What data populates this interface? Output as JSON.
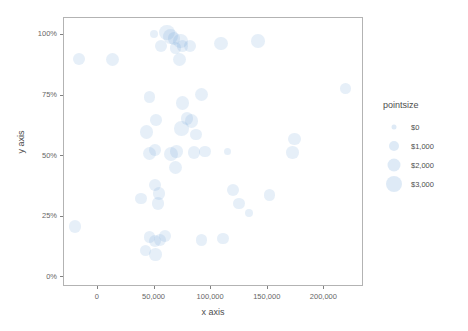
{
  "chart_data": {
    "type": "scatter",
    "title": "",
    "xlabel": "x axis",
    "ylabel": "y axis",
    "xlim": [
      -30000,
      235000
    ],
    "ylim": [
      -0.04,
      1.07
    ],
    "grid": false,
    "legend": {
      "position": "right",
      "title": "pointsize",
      "entries": [
        {
          "label": "$0",
          "value": 0,
          "diameter_px": 5
        },
        {
          "label": "$1,000",
          "value": 1000,
          "diameter_px": 10
        },
        {
          "label": "$2,000",
          "value": 2000,
          "diameter_px": 13
        },
        {
          "label": "$3,000",
          "value": 3000,
          "diameter_px": 16
        }
      ]
    },
    "xticks": [
      {
        "value": 0,
        "label": "0"
      },
      {
        "value": 50000,
        "label": "50,000"
      },
      {
        "value": 100000,
        "label": "100,000"
      },
      {
        "value": 150000,
        "label": "150,000"
      },
      {
        "value": 200000,
        "label": "200,000"
      }
    ],
    "yticks": [
      {
        "value": 0,
        "label": "0%"
      },
      {
        "value": 0.25,
        "label": "25%"
      },
      {
        "value": 0.5,
        "label": "50%"
      },
      {
        "value": 0.75,
        "label": "75%"
      },
      {
        "value": 1.0,
        "label": "100%"
      }
    ],
    "point_color": "#6b9fd4",
    "point_opacity": 0.17,
    "size_key": "pointsize",
    "points": [
      {
        "x": 61000,
        "y": 1.01,
        "size": 2600
      },
      {
        "x": 64000,
        "y": 0.995,
        "size": 2500
      },
      {
        "x": 67000,
        "y": 0.985,
        "size": 1500
      },
      {
        "x": 72500,
        "y": 0.975,
        "size": 2500
      },
      {
        "x": 74500,
        "y": 0.955,
        "size": 1100
      },
      {
        "x": 68500,
        "y": 0.945,
        "size": 1300
      },
      {
        "x": 49500,
        "y": 1.005,
        "size": 300
      },
      {
        "x": 55500,
        "y": 0.955,
        "size": 1500
      },
      {
        "x": 72000,
        "y": 0.9,
        "size": 1800
      },
      {
        "x": 81500,
        "y": 0.955,
        "size": 1500
      },
      {
        "x": 108500,
        "y": 0.965,
        "size": 1900
      },
      {
        "x": 141500,
        "y": 0.975,
        "size": 1900
      },
      {
        "x": -16500,
        "y": 0.9,
        "size": 1300
      },
      {
        "x": 13000,
        "y": 0.9,
        "size": 1700
      },
      {
        "x": 218500,
        "y": 0.78,
        "size": 900
      },
      {
        "x": 45500,
        "y": 0.745,
        "size": 1200
      },
      {
        "x": 91500,
        "y": 0.755,
        "size": 1700
      },
      {
        "x": 74500,
        "y": 0.72,
        "size": 1900
      },
      {
        "x": 51500,
        "y": 0.65,
        "size": 1200
      },
      {
        "x": 78500,
        "y": 0.655,
        "size": 1500
      },
      {
        "x": 82500,
        "y": 0.645,
        "size": 1800
      },
      {
        "x": 74000,
        "y": 0.615,
        "size": 2300
      },
      {
        "x": 43000,
        "y": 0.6,
        "size": 1800
      },
      {
        "x": 86500,
        "y": 0.59,
        "size": 1200
      },
      {
        "x": 173500,
        "y": 0.57,
        "size": 1500
      },
      {
        "x": 50500,
        "y": 0.525,
        "size": 1200
      },
      {
        "x": 45500,
        "y": 0.51,
        "size": 1700
      },
      {
        "x": 64500,
        "y": 0.51,
        "size": 2200
      },
      {
        "x": 69500,
        "y": 0.52,
        "size": 1600
      },
      {
        "x": 85000,
        "y": 0.515,
        "size": 1400
      },
      {
        "x": 94500,
        "y": 0.52,
        "size": 1100
      },
      {
        "x": 172000,
        "y": 0.515,
        "size": 1500
      },
      {
        "x": 68500,
        "y": 0.455,
        "size": 1700
      },
      {
        "x": 114500,
        "y": 0.52,
        "size": 200
      },
      {
        "x": 50500,
        "y": 0.38,
        "size": 1300
      },
      {
        "x": 54000,
        "y": 0.345,
        "size": 1500
      },
      {
        "x": 38000,
        "y": 0.325,
        "size": 1300
      },
      {
        "x": 53000,
        "y": 0.305,
        "size": 1600
      },
      {
        "x": 119500,
        "y": 0.36,
        "size": 1400
      },
      {
        "x": 151500,
        "y": 0.34,
        "size": 1100
      },
      {
        "x": 124500,
        "y": 0.305,
        "size": 1100
      },
      {
        "x": -20500,
        "y": 0.21,
        "size": 1400
      },
      {
        "x": 133500,
        "y": 0.265,
        "size": 400
      },
      {
        "x": 45500,
        "y": 0.165,
        "size": 1300
      },
      {
        "x": 50500,
        "y": 0.15,
        "size": 1500
      },
      {
        "x": 55000,
        "y": 0.155,
        "size": 1500
      },
      {
        "x": 59500,
        "y": 0.17,
        "size": 1400
      },
      {
        "x": 42000,
        "y": 0.11,
        "size": 1200
      },
      {
        "x": 51000,
        "y": 0.095,
        "size": 1600
      },
      {
        "x": 91500,
        "y": 0.155,
        "size": 1200
      },
      {
        "x": 110500,
        "y": 0.16,
        "size": 1300
      }
    ]
  },
  "axes": {
    "x_title": "x axis",
    "y_title": "y axis"
  }
}
